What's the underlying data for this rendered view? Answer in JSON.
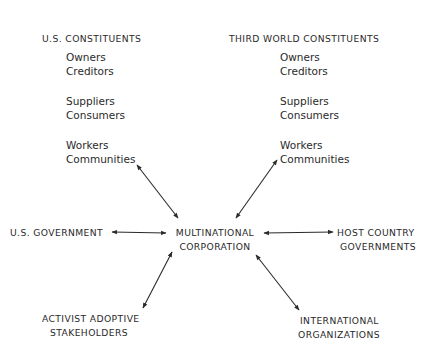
{
  "us_constituents": {
    "title": "U.S. CONSTITUENTS",
    "items": [
      "Owners",
      "Creditors",
      "Suppliers",
      "Consumers",
      "Workers",
      "Communities"
    ]
  },
  "third_world_constituents": {
    "title": "THIRD WORLD CONSTITUENTS",
    "items": [
      "Owners",
      "Creditors",
      "Suppliers",
      "Consumers",
      "Workers",
      "Communities"
    ]
  },
  "center": {
    "line1": "MULTINATIONAL",
    "line2": "CORPORATION"
  },
  "us_government": {
    "label": "U.S. GOVERNMENT"
  },
  "host_country": {
    "line1": "HOST COUNTRY",
    "line2": "GOVERNMENTS"
  },
  "activist": {
    "line1": "ACTIVIST ADOPTIVE",
    "line2": "STAKEHOLDERS"
  },
  "international": {
    "line1": "INTERNATIONAL",
    "line2": "ORGANIZATIONS"
  },
  "connections": [
    {
      "from": "us-constituents",
      "to": "multinational-corporation",
      "type": "bidirectional"
    },
    {
      "from": "third-world-constituents",
      "to": "multinational-corporation",
      "type": "bidirectional"
    },
    {
      "from": "us-government",
      "to": "multinational-corporation",
      "type": "bidirectional"
    },
    {
      "from": "host-country-governments",
      "to": "multinational-corporation",
      "type": "bidirectional"
    },
    {
      "from": "activist-adoptive-stakeholders",
      "to": "multinational-corporation",
      "type": "bidirectional"
    },
    {
      "from": "international-organizations",
      "to": "multinational-corporation",
      "type": "bidirectional"
    }
  ]
}
